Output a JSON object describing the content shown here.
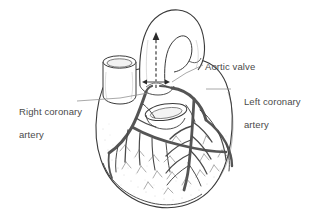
{
  "figure": {
    "background_color": "#ffffff",
    "ink_color": "#333333",
    "vessel_color": "#555555",
    "text_color": "#4a4a4a",
    "shading_color": "#9a9a9a"
  },
  "labels": {
    "aortic_valve": "Aortic valve",
    "left_coronary_line1": "Left coronary",
    "left_coronary_line2": "artery",
    "right_coronary_line1": "Right coronary",
    "right_coronary_line2": "artery"
  },
  "structures": {
    "aorta": "aorta-arch",
    "superior_vena_cava": "cut-vessel-stump",
    "pulmonary_trunk": "cut-vessel-opening",
    "aortic_valve": "aortic-valve",
    "right_coronary_artery": "right-coronary-artery",
    "left_coronary_artery": "left-coronary-artery",
    "ventricles": "ventricular-surface",
    "flow_arrow": "blood-flow-arrow"
  }
}
